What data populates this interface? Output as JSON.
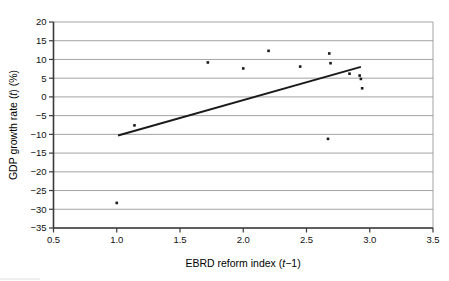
{
  "chart_data": {
    "type": "scatter",
    "title": "",
    "xlabel": "EBRD reform index (t−1)",
    "xlabel_parts": {
      "pre": "EBRD reform index (",
      "ital": "t",
      "post": "−1)"
    },
    "ylabel": "GDP growth rate (t) (%)",
    "ylabel_parts": {
      "pre": "GDP growth rate (",
      "ital": "t",
      "post": ") (%)"
    },
    "xlim": [
      0.5,
      3.5
    ],
    "ylim": [
      -35,
      20
    ],
    "xticks": [
      "0.5",
      "1.0",
      "1.5",
      "2.0",
      "2.5",
      "3.0",
      "3.5"
    ],
    "xtick_values": [
      0.5,
      1.0,
      1.5,
      2.0,
      2.5,
      3.0,
      3.5
    ],
    "yticks": [
      "20",
      "15",
      "10",
      "5",
      "0",
      "−5",
      "−10",
      "−15",
      "−20",
      "−25",
      "−30",
      "−35"
    ],
    "ytick_values": [
      20,
      15,
      10,
      5,
      0,
      -5,
      -10,
      -15,
      -20,
      -25,
      -30,
      -35
    ],
    "grid": {
      "horizontal": true,
      "vertical": false
    },
    "legend": null,
    "marker_color": "#1a1a1a",
    "trend_color": "#1a1a1a",
    "grid_color": "#8d8d8d",
    "points": [
      {
        "x": 1.0,
        "y": -28.3
      },
      {
        "x": 1.14,
        "y": -7.6
      },
      {
        "x": 1.72,
        "y": 9.2
      },
      {
        "x": 2.0,
        "y": 7.6
      },
      {
        "x": 2.2,
        "y": 12.3
      },
      {
        "x": 2.45,
        "y": 8.1
      },
      {
        "x": 2.67,
        "y": -11.2
      },
      {
        "x": 2.68,
        "y": 11.6
      },
      {
        "x": 2.69,
        "y": 9.0
      },
      {
        "x": 2.84,
        "y": 6.2
      },
      {
        "x": 2.92,
        "y": 5.7
      },
      {
        "x": 2.93,
        "y": 4.8
      },
      {
        "x": 2.94,
        "y": 2.3
      }
    ],
    "trend_line": {
      "x1": 1.01,
      "y1": -10.3,
      "x2": 2.93,
      "y2": 8.0
    }
  }
}
